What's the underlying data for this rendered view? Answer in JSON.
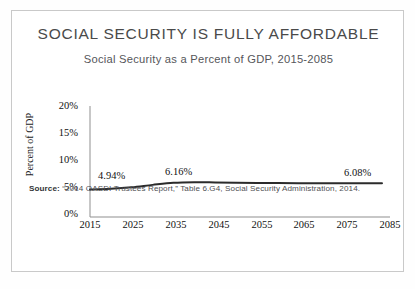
{
  "card": {
    "title": "SOCIAL SECURITY IS FULLY AFFORDABLE",
    "subtitle": "Social Security as a Percent of GDP, 2015-2085",
    "source_label": "Source:",
    "source_text": " “2014 OASDI Trustees Report,” Table 6.G4, Social Security Administration, 2014.",
    "border_color": "#c9c9c9"
  },
  "chart_data": {
    "type": "line",
    "title": "Social Security as a Percent of GDP, 2015-2085",
    "xlabel": "",
    "ylabel": "Percent of GDP",
    "xlim": [
      2015,
      2085
    ],
    "ylim": [
      0,
      20
    ],
    "grid": false,
    "legend": "none",
    "line_color": "#2b2b2b",
    "xticks": [
      "2015",
      "2025",
      "2035",
      "2045",
      "2055",
      "2065",
      "2075",
      "2085"
    ],
    "yticks": [
      "0%",
      "5%",
      "10%",
      "15%",
      "20%"
    ],
    "x": [
      2015,
      2020,
      2025,
      2030,
      2035,
      2040,
      2045,
      2050,
      2055,
      2060,
      2065,
      2070,
      2075,
      2080,
      2085
    ],
    "values": [
      4.94,
      5.08,
      5.36,
      5.79,
      6.16,
      6.27,
      6.23,
      6.17,
      6.13,
      6.11,
      6.09,
      6.07,
      6.06,
      6.07,
      6.08
    ],
    "annotations": [
      {
        "label": "4.94%",
        "x": 2015,
        "y": 4.94
      },
      {
        "label": "6.16%",
        "x": 2035,
        "y": 6.16
      },
      {
        "label": "6.08%",
        "x": 2085,
        "y": 6.08
      }
    ]
  }
}
